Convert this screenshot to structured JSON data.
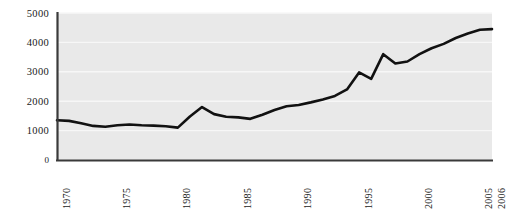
{
  "chart_data": {
    "type": "line",
    "title": "",
    "subtitle": "",
    "xlabel": "",
    "ylabel": "",
    "xlim": [
      1970,
      2006
    ],
    "ylim": [
      0,
      5000
    ],
    "grid": true,
    "grid_axis": "y",
    "legend": null,
    "legend_position": "none",
    "axis_color": "#3a3a3a",
    "line_color": "#111111",
    "plot_background": "#e9e9e9",
    "figure_background": "#ffffff",
    "y_ticks": [
      0,
      1000,
      2000,
      3000,
      4000,
      5000
    ],
    "y_tick_labels": [
      "0",
      "1000",
      "2000",
      "3000",
      "4000",
      "5000"
    ],
    "y_tick_major_labeled": [
      "1000",
      "2000",
      "3000",
      "4000",
      "5000"
    ],
    "x_tick_labels": [
      "1970",
      "1975",
      "1980",
      "1985",
      "1990",
      "1995",
      "2000",
      "2005",
      "2006"
    ],
    "x_tick_values": [
      1970,
      1975,
      1980,
      1985,
      1990,
      1995,
      2000,
      2005,
      2006
    ],
    "x_tick_rotation": 90,
    "x": [
      1970,
      1971,
      1972,
      1973,
      1974,
      1975,
      1976,
      1977,
      1978,
      1979,
      1980,
      1981,
      1982,
      1983,
      1984,
      1985,
      1986,
      1987,
      1988,
      1989,
      1990,
      1991,
      1992,
      1993,
      1994,
      1995,
      1996,
      1997,
      1998,
      1999,
      2000,
      2001,
      2002,
      2003,
      2004,
      2005,
      2006
    ],
    "values": [
      1350,
      1330,
      1250,
      1160,
      1130,
      1180,
      1210,
      1180,
      1170,
      1150,
      1100,
      1480,
      1800,
      1560,
      1470,
      1450,
      1400,
      1540,
      1700,
      1830,
      1870,
      1960,
      2060,
      2180,
      2400,
      2980,
      2760,
      3600,
      3280,
      3350,
      3600,
      3800,
      3950,
      4150,
      4300,
      4430,
      4450
    ],
    "annotations": []
  }
}
